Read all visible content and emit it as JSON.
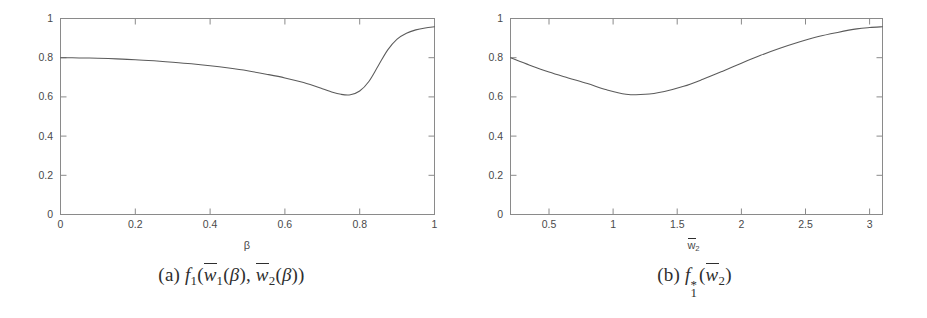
{
  "figure": {
    "background": "#ffffff",
    "ink_color": "#4a4a4a",
    "curve_color": "#5b5b5b"
  },
  "panels": [
    {
      "id": "panel-a",
      "caption_tag": "(a)",
      "caption_math": "f1(w̄2(β), w̄2(β))",
      "caption_parts": {
        "tag": "(a)",
        "f": "f",
        "f_sub": "1",
        "open": "(",
        "w1": "w",
        "w1_sub": "1",
        "arg1_open": "(",
        "beta1": "β",
        "arg1_close": ")",
        "comma": ", ",
        "w2": "w",
        "w2_sub": "2",
        "arg2_open": "(",
        "beta2": "β",
        "arg2_close": ")",
        "close": ")"
      },
      "xlabel": "β",
      "ylabel": "",
      "xticks": [
        "0",
        "0.2",
        "0.4",
        "0.6",
        "0.8",
        "1"
      ],
      "yticks": [
        "0",
        "0.2",
        "0.4",
        "0.6",
        "0.8",
        "1"
      ]
    },
    {
      "id": "panel-b",
      "caption_tag": "(b)",
      "caption_math": "f1*(w̄2)",
      "caption_parts": {
        "tag": "(b)",
        "f": "f",
        "f_sub": "1",
        "f_sup": "*",
        "open": "(",
        "w2": "w",
        "w2_sub": "2",
        "close": ")"
      },
      "xlabel": "w̄2",
      "xlabel_base": "w",
      "xlabel_sub": "2",
      "ylabel": "",
      "xticks": [
        "0.5",
        "1",
        "1.5",
        "2",
        "2.5",
        "3"
      ],
      "yticks": [
        "0",
        "0.2",
        "0.4",
        "0.6",
        "0.8",
        "1"
      ]
    }
  ],
  "chart_data": [
    {
      "type": "line",
      "title": "",
      "panel": "(a)",
      "xlabel": "β",
      "ylabel": "",
      "xlim": [
        0,
        1
      ],
      "ylim": [
        0,
        1
      ],
      "xticks": [
        0,
        0.2,
        0.4,
        0.6,
        0.8,
        1
      ],
      "yticks": [
        0,
        0.2,
        0.4,
        0.6,
        0.8,
        1
      ],
      "grid": false,
      "legend": "none",
      "series": [
        {
          "name": "f1(w1bar(beta), w2bar(beta))",
          "x": [
            0.0,
            0.05,
            0.1,
            0.15,
            0.2,
            0.25,
            0.3,
            0.35,
            0.4,
            0.45,
            0.5,
            0.55,
            0.6,
            0.65,
            0.7,
            0.725,
            0.75,
            0.775,
            0.8,
            0.825,
            0.85,
            0.875,
            0.9,
            0.925,
            0.95,
            0.975,
            1.0
          ],
          "y": [
            0.8,
            0.799,
            0.797,
            0.794,
            0.79,
            0.784,
            0.777,
            0.769,
            0.759,
            0.747,
            0.733,
            0.716,
            0.697,
            0.673,
            0.642,
            0.625,
            0.613,
            0.611,
            0.63,
            0.68,
            0.76,
            0.84,
            0.895,
            0.925,
            0.942,
            0.952,
            0.958
          ]
        }
      ]
    },
    {
      "type": "line",
      "title": "",
      "panel": "(b)",
      "xlabel": "w̄2",
      "ylabel": "",
      "xlim": [
        0.2,
        3.1
      ],
      "ylim": [
        0,
        1
      ],
      "xticks": [
        0.5,
        1,
        1.5,
        2,
        2.5,
        3
      ],
      "yticks": [
        0,
        0.2,
        0.4,
        0.6,
        0.8,
        1
      ],
      "grid": false,
      "legend": "none",
      "series": [
        {
          "name": "f1*(w2bar)",
          "x": [
            0.2,
            0.35,
            0.5,
            0.65,
            0.8,
            0.95,
            1.1,
            1.25,
            1.4,
            1.55,
            1.7,
            1.85,
            2.0,
            2.15,
            2.3,
            2.45,
            2.6,
            2.75,
            2.9,
            3.0,
            3.1
          ],
          "y": [
            0.8,
            0.762,
            0.727,
            0.697,
            0.668,
            0.636,
            0.614,
            0.613,
            0.628,
            0.654,
            0.69,
            0.73,
            0.772,
            0.812,
            0.848,
            0.88,
            0.908,
            0.929,
            0.947,
            0.954,
            0.958
          ]
        }
      ]
    }
  ]
}
